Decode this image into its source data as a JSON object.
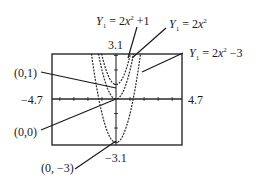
{
  "chart_data": {
    "type": "line",
    "title": "",
    "xlabel": "",
    "ylabel": "",
    "xlim": [
      -4.7,
      4.7
    ],
    "ylim": [
      -3.1,
      3.1
    ],
    "grid": false,
    "axis_ticks": {
      "x_step": 1,
      "y_step": 1
    },
    "window_labels": {
      "xmin": "−4.7",
      "xmax": "4.7",
      "ymin": "−3.1",
      "ymax": "3.1"
    },
    "series": [
      {
        "name": "Y1 = 2x^2 + 1",
        "a": 2,
        "k": 1,
        "vertex": [
          0,
          1
        ],
        "style": "dashed"
      },
      {
        "name": "Y1 = 2x^2",
        "a": 2,
        "k": 0,
        "vertex": [
          0,
          0
        ],
        "style": "dashed"
      },
      {
        "name": "Y1 = 2x^2 − 3",
        "a": 2,
        "k": -3,
        "vertex": [
          0,
          -3
        ],
        "style": "dashed"
      }
    ],
    "annotations": [
      {
        "text": "(0,1)",
        "points_to": [
          0,
          1
        ]
      },
      {
        "text": "(0,0)",
        "points_to": [
          0,
          0
        ]
      },
      {
        "text": "(0, −3)",
        "points_to": [
          0,
          -3
        ]
      },
      {
        "text": "Y1 = 2x^2 + 1",
        "points_to_series": 0
      },
      {
        "text": "Y1 = 2x^2",
        "points_to_series": 1
      },
      {
        "text": "Y1 = 2x^2 − 3",
        "points_to_series": 2
      }
    ]
  },
  "labels": {
    "ymax": "3.1",
    "ymin": "−3.1",
    "xmin": "−4.7",
    "xmax": "4.7",
    "vertex1": "(0,1)",
    "vertex0": "(0,0)",
    "vertex3": "(0, −3)",
    "eq_plus1": {
      "Y": "Y",
      "sub": "1",
      "mid": " = 2",
      "x": "x",
      "sup": "2",
      "tail": " +1"
    },
    "eq_zero": {
      "Y": "Y",
      "sub": "1",
      "mid": " = 2",
      "x": "x",
      "sup": "2",
      "tail": ""
    },
    "eq_minus3": {
      "Y": "Y",
      "sub": "1",
      "mid": " = 2",
      "x": "x",
      "sup": "2",
      "tail": " −3"
    }
  }
}
